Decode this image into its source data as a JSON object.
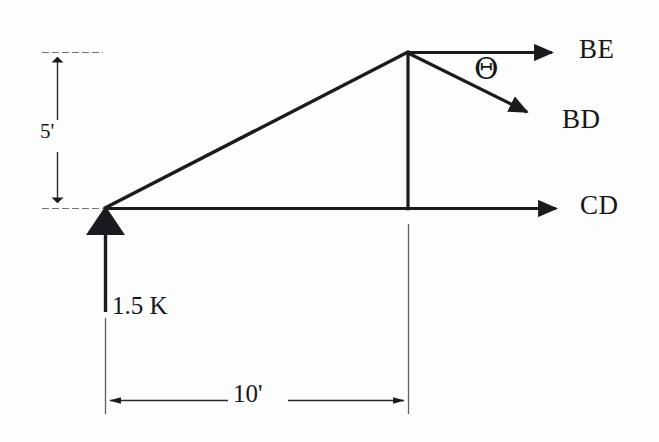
{
  "figure": {
    "background_color": "#fdfdfd",
    "ink_color": "#17171a",
    "labels": {
      "member_be": "BE",
      "member_bd": "BD",
      "member_cd": "CD",
      "angle": "Θ",
      "applied_load": "1.5 K",
      "height_dimension": "5'",
      "span_dimension": "10'"
    },
    "geometry": {
      "left_joint": {
        "x": 105,
        "y": 208
      },
      "apex_joint": {
        "x": 408,
        "y": 52
      },
      "base_right": {
        "x": 408,
        "y": 208
      },
      "be_arrow_tip": {
        "x": 570,
        "y": 52
      },
      "bd_arrow_tip": {
        "x": 552,
        "y": 124
      },
      "cd_arrow_tip": {
        "x": 572,
        "y": 208
      },
      "load_arrow_tip": {
        "x": 105,
        "y": 208
      },
      "load_arrow_tail": {
        "x": 105,
        "y": 312
      },
      "height_dim_x": 57,
      "height_dim_top_y": 52,
      "height_dim_bottom_y": 208,
      "span_dim_y": 400,
      "span_dim_left_x": 105,
      "span_dim_right_x": 408
    },
    "values": {
      "height_ft": 5,
      "span_ft": 10,
      "load_kips": 1.5
    }
  }
}
